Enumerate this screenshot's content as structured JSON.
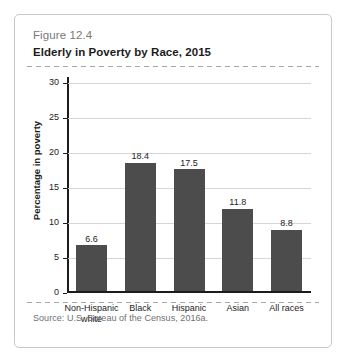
{
  "figure": {
    "number": "Figure 12.4",
    "title": "Elderly in Poverty by Race, 2015",
    "source": "Source: U.S. Bureau of the Census, 2016a."
  },
  "chart_data": {
    "type": "bar",
    "title": "Elderly in Poverty by Race, 2015",
    "xlabel": "",
    "ylabel": "Percentage in poverty",
    "categories": [
      "Non-Hispanic white",
      "Black",
      "Hispanic",
      "Asian",
      "All races"
    ],
    "category_lines": [
      [
        "Non-Hispanic",
        "white"
      ],
      [
        "Black"
      ],
      [
        "Hispanic"
      ],
      [
        "Asian"
      ],
      [
        "All races"
      ]
    ],
    "values": [
      6.6,
      18.4,
      17.5,
      11.8,
      8.8
    ],
    "value_labels": [
      "6.6",
      "18.4",
      "17.5",
      "11.8",
      "8.8"
    ],
    "ylim": [
      0,
      30
    ],
    "yticks": [
      0,
      5,
      10,
      15,
      20,
      25,
      30
    ],
    "ytick_labels": [
      "0",
      "5",
      "10",
      "15",
      "20",
      "25",
      "30"
    ],
    "grid": true,
    "legend": false,
    "bar_color": "#4c4c4c",
    "gridline_color": "#d6d6d6",
    "axis_color": "#1c1c1c"
  }
}
